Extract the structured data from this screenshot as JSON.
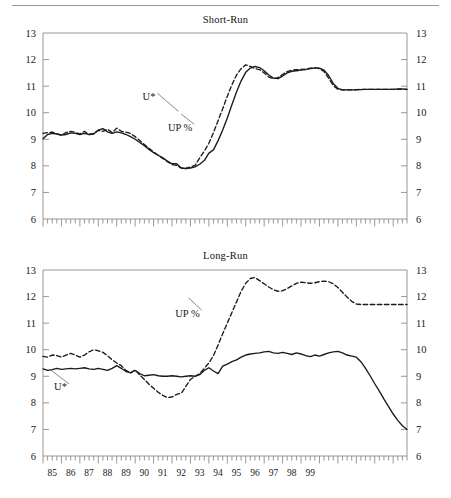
{
  "figure": {
    "has_top_rule": true,
    "background": "#ffffff",
    "ink": "#1a1a1a",
    "axis_color": "#8c8c8c"
  },
  "chart_data": [
    {
      "type": "line",
      "title": "Short-Run",
      "xlabel": "",
      "ylabel": "",
      "ylim": [
        6,
        13
      ],
      "yticks": [
        6,
        7,
        8,
        9,
        10,
        11,
        12,
        13
      ],
      "ytick_labels": [
        "6",
        "7",
        "8",
        "9",
        "10",
        "11",
        "12",
        "13"
      ],
      "y_axis_both_sides": true,
      "grid": false,
      "legend_position": "inline-annotation",
      "x_start_year": 1985,
      "x_end_year": 1999.75,
      "x_frequency": "quarterly",
      "xticks": [
        85,
        86,
        87,
        88,
        89,
        90,
        91,
        92,
        93,
        94,
        95,
        96,
        97,
        98,
        99
      ],
      "xtick_labels": [
        "",
        "",
        "",
        "",
        "",
        "",
        "",
        "",
        "",
        "",
        "",
        "",
        "",
        "",
        ""
      ],
      "x_labels_shown": false,
      "annotations": [
        {
          "text": "U*",
          "x": 1991.1,
          "y": 10.62,
          "leader_to_x": 1992.35,
          "leader_to_y": 10.05
        },
        {
          "text": "UP %",
          "x": 1993.1,
          "y": 9.45,
          "leader_to_x": 1992.5,
          "leader_to_y": 9.95
        }
      ],
      "series": [
        {
          "name": "U*",
          "style": "dashed",
          "color": "#1a1a1a",
          "values": [
            9.22,
            9.25,
            9.27,
            9.2,
            9.15,
            9.25,
            9.3,
            9.26,
            9.2,
            9.3,
            9.18,
            9.22,
            9.34,
            9.3,
            9.38,
            9.25,
            9.42,
            9.3,
            9.27,
            9.22,
            9.1,
            8.95,
            8.8,
            8.66,
            8.52,
            8.4,
            8.28,
            8.16,
            8.05,
            8.02,
            7.92,
            7.9,
            7.96,
            8.02,
            8.3,
            8.55,
            8.85,
            9.25,
            9.7,
            10.15,
            10.62,
            11.05,
            11.42,
            11.66,
            11.8,
            11.74,
            11.66,
            11.62,
            11.5,
            11.34,
            11.28,
            11.32,
            11.44,
            11.55,
            11.6,
            11.62,
            11.63,
            11.64,
            11.68,
            11.7,
            11.66,
            11.55,
            11.3,
            11.02,
            10.88,
            10.86,
            10.86,
            10.86,
            10.87,
            10.88,
            10.88,
            10.88,
            10.88,
            10.88,
            10.88,
            10.88,
            10.88,
            10.88,
            10.88,
            10.88
          ]
        },
        {
          "name": "UP %",
          "style": "solid",
          "color": "#1a1a1a",
          "values": [
            9.02,
            9.18,
            9.22,
            9.2,
            9.16,
            9.18,
            9.24,
            9.22,
            9.18,
            9.22,
            9.18,
            9.2,
            9.34,
            9.4,
            9.28,
            9.22,
            9.28,
            9.24,
            9.18,
            9.1,
            9.0,
            8.88,
            8.76,
            8.62,
            8.5,
            8.4,
            8.3,
            8.18,
            8.08,
            8.08,
            7.92,
            7.9,
            7.92,
            7.96,
            8.06,
            8.2,
            8.48,
            8.6,
            8.95,
            9.35,
            9.8,
            10.3,
            10.78,
            11.2,
            11.52,
            11.68,
            11.74,
            11.7,
            11.58,
            11.42,
            11.3,
            11.28,
            11.38,
            11.5,
            11.56,
            11.58,
            11.6,
            11.62,
            11.66,
            11.68,
            11.68,
            11.6,
            11.4,
            11.1,
            10.92,
            10.86,
            10.86,
            10.86,
            10.86,
            10.87,
            10.88,
            10.88,
            10.88,
            10.88,
            10.88,
            10.88,
            10.88,
            10.9,
            10.9,
            10.88
          ]
        }
      ]
    },
    {
      "type": "line",
      "title": "Long-Run",
      "xlabel": "",
      "ylabel": "",
      "ylim": [
        6,
        13
      ],
      "yticks": [
        6,
        7,
        8,
        9,
        10,
        11,
        12,
        13
      ],
      "ytick_labels": [
        "6",
        "7",
        "8",
        "9",
        "10",
        "11",
        "12",
        "13"
      ],
      "y_axis_both_sides": true,
      "grid": false,
      "legend_position": "inline-annotation",
      "x_start_year": 1985,
      "x_end_year": 1999.75,
      "x_frequency": "quarterly",
      "xticks": [
        85,
        86,
        87,
        88,
        89,
        90,
        91,
        92,
        93,
        94,
        95,
        96,
        97,
        98,
        99
      ],
      "xtick_labels": [
        "85",
        "86",
        "87",
        "88",
        "89",
        "90",
        "91",
        "92",
        "93",
        "94",
        "95",
        "96",
        "97",
        "98",
        "99"
      ],
      "x_labels_shown": true,
      "annotations": [
        {
          "text": "U*",
          "x": 1986.3,
          "y": 8.6,
          "leader_to_x": 1985.4,
          "leader_to_y": 9.25
        },
        {
          "text": "UP %",
          "x": 1993.5,
          "y": 11.38,
          "leader_to_x": 1992.9,
          "leader_to_y": 11.95
        }
      ],
      "series": [
        {
          "name": "U*",
          "style": "solid",
          "color": "#1a1a1a",
          "values": [
            9.28,
            9.22,
            9.25,
            9.3,
            9.26,
            9.28,
            9.3,
            9.28,
            9.3,
            9.32,
            9.28,
            9.26,
            9.3,
            9.26,
            9.22,
            9.3,
            9.4,
            9.3,
            9.18,
            9.14,
            9.22,
            9.1,
            9.02,
            9.04,
            9.06,
            9.02,
            9.0,
            9.0,
            9.02,
            9.0,
            8.98,
            9.0,
            9.02,
            9.0,
            9.06,
            9.22,
            9.32,
            9.2,
            9.1,
            9.38,
            9.46,
            9.55,
            9.62,
            9.72,
            9.8,
            9.84,
            9.86,
            9.88,
            9.92,
            9.94,
            9.88,
            9.86,
            9.9,
            9.86,
            9.82,
            9.88,
            9.84,
            9.78,
            9.74,
            9.8,
            9.76,
            9.82,
            9.88,
            9.92,
            9.94,
            9.88,
            9.8,
            9.76,
            9.72,
            9.55,
            9.3,
            9.02,
            8.72,
            8.44,
            8.14,
            7.86,
            7.58,
            7.34,
            7.14,
            7.0
          ]
        },
        {
          "name": "UP %",
          "style": "dashed",
          "color": "#1a1a1a",
          "values": [
            9.75,
            9.72,
            9.8,
            9.78,
            9.72,
            9.8,
            9.86,
            9.8,
            9.72,
            9.8,
            9.92,
            10.0,
            9.96,
            9.9,
            9.78,
            9.62,
            9.5,
            9.4,
            9.22,
            9.12,
            9.24,
            9.05,
            8.88,
            8.7,
            8.55,
            8.4,
            8.28,
            8.2,
            8.22,
            8.32,
            8.36,
            8.62,
            8.88,
            9.0,
            9.1,
            9.3,
            9.5,
            9.78,
            10.18,
            10.6,
            11.0,
            11.4,
            11.8,
            12.2,
            12.5,
            12.68,
            12.72,
            12.6,
            12.48,
            12.36,
            12.26,
            12.2,
            12.22,
            12.3,
            12.4,
            12.5,
            12.54,
            12.52,
            12.5,
            12.52,
            12.56,
            12.58,
            12.56,
            12.48,
            12.34,
            12.16,
            11.98,
            11.82,
            11.72,
            11.7,
            11.7,
            11.7,
            11.7,
            11.7,
            11.7,
            11.7,
            11.7,
            11.7,
            11.7,
            11.7
          ]
        }
      ]
    }
  ]
}
